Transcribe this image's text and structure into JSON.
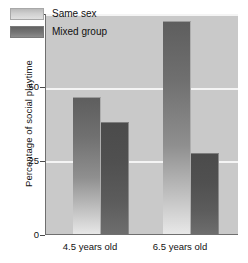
{
  "chart_data": {
    "type": "bar",
    "title": "",
    "xlabel": "",
    "ylabel": "Percentage of social playtime",
    "categories": [
      "4.5 years old",
      "6.5 years old"
    ],
    "series": [
      {
        "name": "Same sex",
        "values": [
          47,
          72.5
        ],
        "color": "#8f8f8f"
      },
      {
        "name": "Mixed group",
        "values": [
          38.5,
          28
        ],
        "color": "#545454"
      }
    ],
    "ylim": [
      0,
      75
    ],
    "yticks": [
      0,
      25,
      50,
      75
    ],
    "ytick_labels": [
      "0",
      "25",
      "50",
      "75"
    ],
    "grid": true,
    "gridlines_at": [
      25,
      50,
      75
    ],
    "legend_position": "top-left",
    "plot_background": "#c9c9c9",
    "gridline_color": "#f4f4f4",
    "axis_color": "#6f6f6f"
  },
  "axis": {
    "y_title": "Percentage of social playtime",
    "tick_75": "75",
    "tick_50": "50",
    "tick_25": "25",
    "tick_0": "0"
  },
  "legend": {
    "item_same_label": "Same sex",
    "item_mixed_label": "Mixed group"
  },
  "xaxis": {
    "group_1": "4.5 years old",
    "group_2": "6.5 years old"
  }
}
